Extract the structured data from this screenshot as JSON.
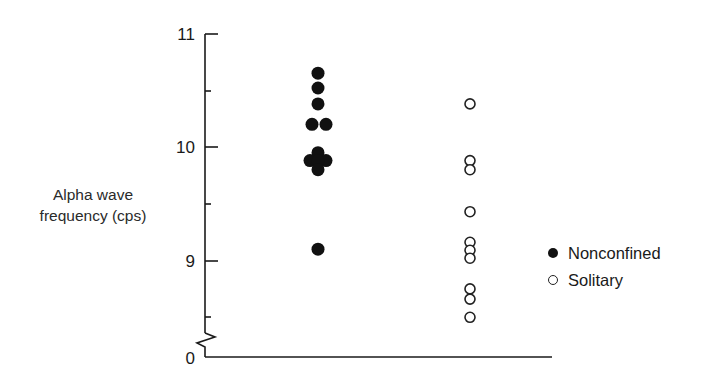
{
  "chart_data": {
    "type": "scatter",
    "title": "",
    "xlabel": "",
    "ylabel": "Alpha wave frequency (cps)",
    "ylim": [
      8.3,
      11
    ],
    "y_axis_break": true,
    "y_ticks": [
      0,
      9,
      10,
      11
    ],
    "y_tick_labels": [
      "0",
      "9",
      "10",
      "11"
    ],
    "y_minor_ticks": [
      8.5,
      9.5,
      10.5
    ],
    "grid": false,
    "legend_position": "right",
    "series": [
      {
        "name": "Nonconfined",
        "marker": "filled-circle",
        "values": [
          10.65,
          10.52,
          10.38,
          10.2,
          10.2,
          9.95,
          9.88,
          9.88,
          9.88,
          9.8,
          9.1
        ]
      },
      {
        "name": "Solitary",
        "marker": "open-circle",
        "values": [
          10.38,
          9.88,
          9.8,
          9.43,
          9.16,
          9.09,
          9.02,
          8.75,
          8.66,
          8.5
        ]
      }
    ]
  },
  "axis": {
    "ylabel_line1": "Alpha wave",
    "ylabel_line2": "frequency (cps)"
  },
  "legend": {
    "items": [
      {
        "label": "Nonconfined",
        "marker": "filled"
      },
      {
        "label": "Solitary",
        "marker": "open"
      }
    ]
  },
  "layout": {
    "filled_points": [
      {
        "x": 318,
        "v": 10.65
      },
      {
        "x": 318,
        "v": 10.52
      },
      {
        "x": 318,
        "v": 10.38
      },
      {
        "x": 312,
        "v": 10.2
      },
      {
        "x": 326,
        "v": 10.2
      },
      {
        "x": 318,
        "v": 9.95
      },
      {
        "x": 310,
        "v": 9.88
      },
      {
        "x": 326,
        "v": 9.88
      },
      {
        "x": 318,
        "v": 9.88
      },
      {
        "x": 318,
        "v": 9.8
      },
      {
        "x": 318,
        "v": 9.1
      }
    ],
    "open_points": [
      {
        "x": 470,
        "v": 10.38
      },
      {
        "x": 470,
        "v": 9.88
      },
      {
        "x": 470,
        "v": 9.8
      },
      {
        "x": 470,
        "v": 9.43
      },
      {
        "x": 470,
        "v": 9.16
      },
      {
        "x": 470,
        "v": 9.09
      },
      {
        "x": 470,
        "v": 9.02
      },
      {
        "x": 470,
        "v": 8.75
      },
      {
        "x": 470,
        "v": 8.66
      },
      {
        "x": 470,
        "v": 8.5
      }
    ]
  }
}
